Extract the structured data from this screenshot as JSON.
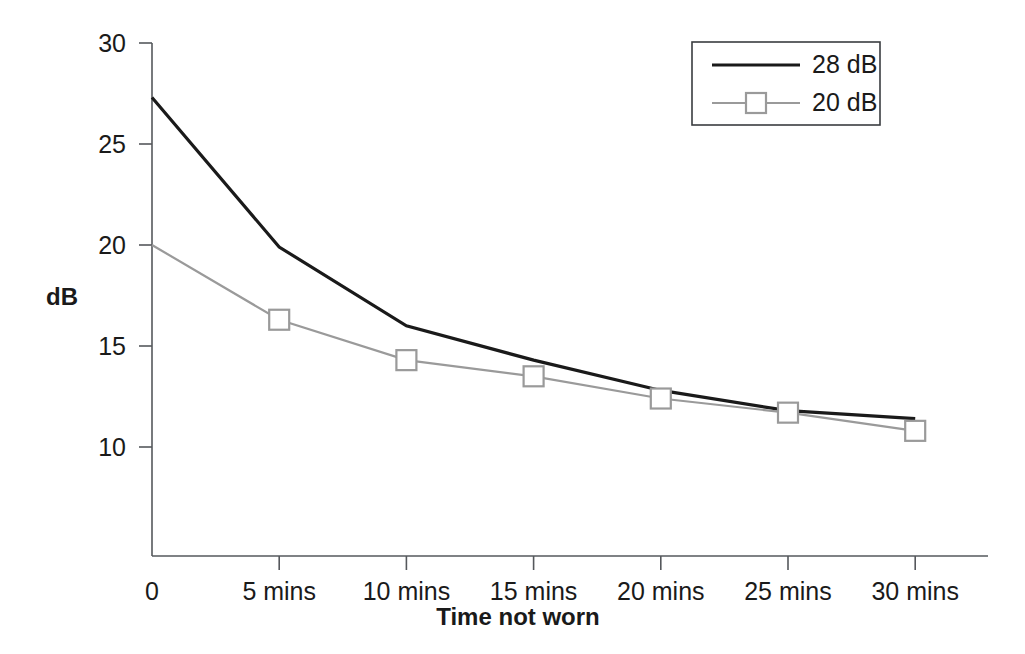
{
  "chart_data": {
    "type": "line",
    "title": "",
    "xlabel": "Time not worn",
    "ylabel": "dB",
    "categories": [
      "0",
      "5 mins",
      "10 mins",
      "15 mins",
      "20 mins",
      "25 mins",
      "30 mins"
    ],
    "x": [
      0,
      5,
      10,
      15,
      20,
      25,
      30
    ],
    "xlim": [
      0,
      33
    ],
    "ylim": [
      5,
      30
    ],
    "y_ticks": [
      30,
      25,
      20,
      15,
      10
    ],
    "x_ticks": [
      "0",
      "5 mins",
      "10 mins",
      "15 mins",
      "20 mins",
      "25 mins",
      "30 mins"
    ],
    "grid": false,
    "legend_position": "top-right",
    "series": [
      {
        "name": "28 dB",
        "color": "#1a1a1a",
        "line_width": 3.2,
        "marker": "none",
        "values": [
          27.3,
          19.9,
          16.0,
          14.3,
          12.8,
          11.8,
          11.4
        ]
      },
      {
        "name": "20 dB",
        "color": "#9a9a9a",
        "line_width": 2.2,
        "marker": "square",
        "marker_size": 20,
        "marker_x_skip_first": true,
        "values": [
          20.0,
          16.3,
          14.3,
          13.5,
          12.4,
          11.7,
          10.8
        ]
      }
    ]
  },
  "legend": {
    "entries": [
      {
        "label": "28 dB"
      },
      {
        "label": "20 dB"
      }
    ]
  },
  "axis": {
    "y_title": "dB",
    "x_title": "Time not worn"
  }
}
